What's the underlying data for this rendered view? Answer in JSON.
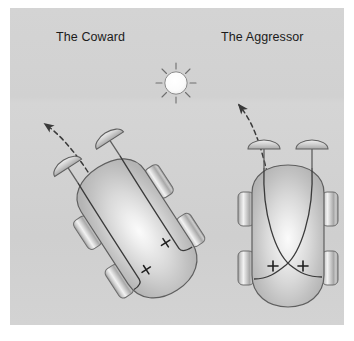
{
  "figure": {
    "title_left": "The Coward",
    "title_right": "The Aggressor",
    "background_color": "#d2d2d2",
    "page_color": "#ffffff",
    "ink_color": "#2a2a2a"
  },
  "light_source": {
    "name": "light-source",
    "icon": "sun-icon",
    "center_x": 176,
    "center_y": 83,
    "radius": 11,
    "ray_count": 8,
    "fill": "#fdfdfd"
  },
  "vehicles": [
    {
      "id": "coward",
      "label": "The Coward",
      "wiring": "uncrossed",
      "rotation_deg": -33,
      "center_x": 137,
      "center_y": 228,
      "sensor_count": 2,
      "motor_count": 2,
      "wheel_count": 4,
      "connection_signs": [
        "+",
        "+"
      ],
      "trajectory": "turns away from the light"
    },
    {
      "id": "aggressor",
      "label": "The Aggressor",
      "wiring": "crossed",
      "rotation_deg": 0,
      "center_x": 288,
      "center_y": 235,
      "sensor_count": 2,
      "motor_count": 2,
      "wheel_count": 4,
      "connection_signs": [
        "+",
        "+"
      ],
      "trajectory": "turns toward the light"
    }
  ],
  "arrows": [
    {
      "id": "coward-path",
      "name": "coward-trajectory-arrow",
      "style": "dashed-curve",
      "head": "arrowhead pointing up-left"
    },
    {
      "id": "aggressor-path",
      "name": "aggressor-trajectory-arrow",
      "style": "dashed-curve",
      "head": "arrowhead pointing up-left"
    }
  ]
}
